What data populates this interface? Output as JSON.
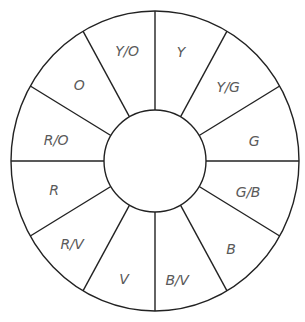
{
  "diagram": {
    "type": "color-wheel",
    "center": {
      "x": 155,
      "y": 161
    },
    "outer_radius": {
      "rx": 144,
      "ry": 150
    },
    "inner_radius": 51,
    "stroke_color": "#222222",
    "label_color": "#5a5a5a",
    "segments": [
      {
        "label": "Y",
        "x": 181,
        "y": 53
      },
      {
        "label": "Y/G",
        "x": 228,
        "y": 88
      },
      {
        "label": "G",
        "x": 254,
        "y": 142
      },
      {
        "label": "G/B",
        "x": 248,
        "y": 193
      },
      {
        "label": "B",
        "x": 231,
        "y": 250
      },
      {
        "label": "B/V",
        "x": 177,
        "y": 281
      },
      {
        "label": "V",
        "x": 124,
        "y": 280
      },
      {
        "label": "R/V",
        "x": 72,
        "y": 245
      },
      {
        "label": "R",
        "x": 54,
        "y": 191
      },
      {
        "label": "R/O",
        "x": 56,
        "y": 141
      },
      {
        "label": "O",
        "x": 79,
        "y": 86
      },
      {
        "label": "Y/O",
        "x": 127,
        "y": 52
      }
    ]
  }
}
